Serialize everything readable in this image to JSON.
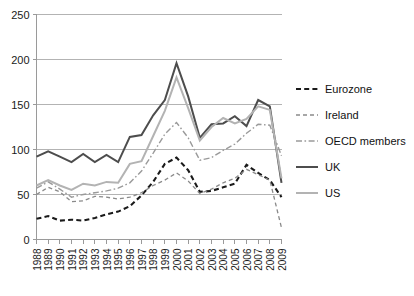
{
  "chart_data": {
    "type": "line",
    "title": "",
    "xlabel": "",
    "ylabel": "",
    "xlim": [
      1988,
      2009
    ],
    "ylim": [
      0,
      250
    ],
    "yticks": [
      0,
      50,
      100,
      150,
      200,
      250
    ],
    "grid": true,
    "legend_position": "right",
    "categories": [
      "1988",
      "1989",
      "1990",
      "1991",
      "1992",
      "1993",
      "1994",
      "1995",
      "1996",
      "1997",
      "1998",
      "1999",
      "2000",
      "2001",
      "2002",
      "2003",
      "2004",
      "2005",
      "2006",
      "2007",
      "2008",
      "2009"
    ],
    "series": [
      {
        "name": "Eurozone",
        "color": "#1a1a1a",
        "style": "dashed",
        "width": 2.1,
        "values": [
          23,
          26,
          21,
          22,
          21,
          24,
          28,
          31,
          37,
          49,
          64,
          84,
          91,
          77,
          53,
          54,
          58,
          62,
          83,
          74,
          66,
          47
        ]
      },
      {
        "name": "Ireland",
        "color": "#8a8a8a",
        "style": "dashed",
        "width": 1.3,
        "values": [
          50,
          58,
          53,
          42,
          43,
          48,
          47,
          45,
          47,
          52,
          60,
          66,
          74,
          65,
          51,
          56,
          63,
          68,
          78,
          72,
          66,
          13
        ]
      },
      {
        "name": "OECD members",
        "color": "#9a9a9a",
        "style": "dashdot",
        "width": 1.4,
        "values": [
          57,
          64,
          56,
          47,
          50,
          52,
          54,
          57,
          63,
          76,
          96,
          117,
          130,
          113,
          88,
          91,
          99,
          106,
          118,
          128,
          127,
          93
        ]
      },
      {
        "name": "UK",
        "color": "#4d4d4d",
        "style": "solid",
        "width": 2.0,
        "values": [
          92,
          98,
          92,
          86,
          95,
          86,
          94,
          86,
          114,
          116,
          138,
          155,
          196,
          159,
          113,
          128,
          129,
          137,
          126,
          155,
          148,
          63
        ]
      },
      {
        "name": "US",
        "color": "#b3b3b3",
        "style": "solid",
        "width": 2.0,
        "values": [
          60,
          66,
          60,
          55,
          62,
          60,
          64,
          63,
          84,
          87,
          115,
          143,
          180,
          146,
          110,
          125,
          135,
          129,
          134,
          148,
          144,
          68
        ]
      }
    ]
  },
  "legend": {
    "items": [
      {
        "label": "Eurozone"
      },
      {
        "label": "Ireland"
      },
      {
        "label": "OECD members"
      },
      {
        "label": "UK"
      },
      {
        "label": "US"
      }
    ]
  },
  "axes": {
    "y_tick_labels": [
      "250",
      "200",
      "150",
      "100",
      "50",
      "0"
    ],
    "x_tick_labels": [
      "1988",
      "1989",
      "1990",
      "1991",
      "1992",
      "1993",
      "1994",
      "1995",
      "1996",
      "1997",
      "1998",
      "1999",
      "2000",
      "2001",
      "2002",
      "2003",
      "2004",
      "2005",
      "2006",
      "2007",
      "2008",
      "2009"
    ]
  }
}
